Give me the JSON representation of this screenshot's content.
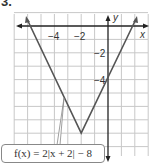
{
  "problem_number": "3.",
  "graph": {
    "x_axis_label": "x",
    "y_axis_label": "y",
    "x_tick_labels": [
      "−4",
      "−2"
    ],
    "y_tick_labels": [
      "−2",
      "−4"
    ],
    "function_label": "f(x) = 2|x + 2| − 8",
    "vertex": [
      -2,
      -8
    ],
    "x_range": [
      -7,
      3
    ],
    "y_range": [
      -10,
      1
    ]
  },
  "colors": {
    "grid": "#c8c8c8",
    "axis": "#222222",
    "curve": "#555555",
    "text": "#333333"
  }
}
